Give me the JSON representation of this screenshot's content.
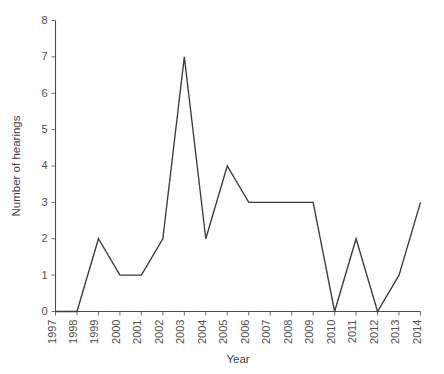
{
  "chart_data": {
    "type": "line",
    "title": "",
    "xlabel": "Year",
    "ylabel": "Number of hearings",
    "categories": [
      "1997",
      "1998",
      "1999",
      "2000",
      "2001",
      "2002",
      "2003",
      "2004",
      "2005",
      "2006",
      "2007",
      "2008",
      "2009",
      "2010",
      "2011",
      "2012",
      "2013",
      "2014"
    ],
    "x": [
      1997,
      1998,
      1999,
      2000,
      2001,
      2002,
      2003,
      2004,
      2005,
      2006,
      2007,
      2008,
      2009,
      2010,
      2011,
      2012,
      2013,
      2014
    ],
    "values": [
      0,
      0,
      2,
      1,
      1,
      2,
      7,
      2,
      4,
      3,
      3,
      3,
      3,
      0,
      2,
      0,
      1,
      3
    ],
    "series": [
      {
        "name": "Number of hearings",
        "values": [
          0,
          0,
          2,
          1,
          1,
          2,
          7,
          2,
          4,
          3,
          3,
          3,
          3,
          0,
          2,
          0,
          1,
          3
        ]
      }
    ],
    "xlim": [
      1997,
      2014
    ],
    "ylim": [
      0,
      8
    ],
    "ytick_labels": [
      "0",
      "1",
      "2",
      "3",
      "4",
      "5",
      "6",
      "7",
      "8"
    ],
    "ytick_values": [
      0,
      1,
      2,
      3,
      4,
      5,
      6,
      7,
      8
    ],
    "xtick_labels": [
      "1997",
      "1998",
      "1999",
      "2000",
      "2001",
      "2002",
      "2003",
      "2004",
      "2005",
      "2006",
      "2007",
      "2008",
      "2009",
      "2010",
      "2011",
      "2012",
      "2013",
      "2014"
    ],
    "grid": false,
    "legend": false,
    "legend_position": "none",
    "line_color": "#3b3b3b",
    "axis_color": "#4a4a4a",
    "background_color": "#ffffff",
    "marker": "none",
    "xtick_rotation": 90
  }
}
